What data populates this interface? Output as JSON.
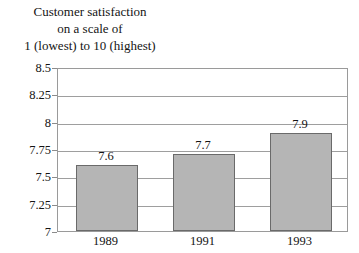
{
  "chart_data": {
    "type": "bar",
    "title": "Customer satisfaction on a scale of 1 (lowest) to 10 (highest)",
    "title_lines": [
      "Customer satisfaction",
      "on a scale of",
      "1 (lowest) to 10 (highest)"
    ],
    "categories": [
      "1989",
      "1991",
      "1993"
    ],
    "values": [
      7.6,
      7.7,
      7.9
    ],
    "value_labels": [
      "7.6",
      "7.7",
      "7.9"
    ],
    "series": [
      {
        "name": "Customer satisfaction",
        "values": [
          7.6,
          7.7,
          7.9
        ]
      }
    ],
    "xlabel": "",
    "ylabel": "",
    "ylim": [
      7,
      8.5
    ],
    "ytick_labels": [
      "8.5",
      "8.25",
      "8",
      "7.75",
      "7.5",
      "7.25",
      "7"
    ],
    "ytick_values": [
      8.5,
      8.25,
      8,
      7.75,
      7.5,
      7.25,
      7
    ],
    "grid": true,
    "legend": false,
    "bar_color": "#b5b5b5",
    "bar_border_color": "#6a6a6a",
    "grid_color": "#9e9e9e",
    "frame_color": "#9a9a9a",
    "background_color": "#ffffff",
    "text_color": "#141414"
  }
}
